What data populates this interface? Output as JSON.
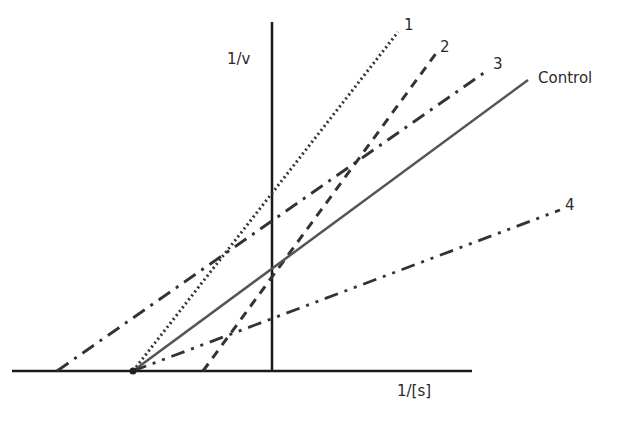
{
  "chart_data": {
    "type": "line",
    "title": "",
    "xlabel": "1/[s]",
    "ylabel": "1/v",
    "grid": false,
    "legend": "inline labels at line ends",
    "axes": {
      "x_axis": {
        "x1": 12,
        "x2": 472,
        "y": 371
      },
      "y_axis": {
        "x": 272,
        "y1": 22,
        "y2": 371
      }
    },
    "series": [
      {
        "name": "1",
        "style": "dotted",
        "color": "#333333",
        "x1": 133,
        "y1": 371,
        "x2": 398,
        "y2": 32
      },
      {
        "name": "2",
        "style": "dashed",
        "color": "#333333",
        "x1": 203,
        "y1": 371,
        "x2": 437,
        "y2": 52
      },
      {
        "name": "3",
        "style": "dash-dot",
        "color": "#333333",
        "x1": 57,
        "y1": 371,
        "x2": 488,
        "y2": 70
      },
      {
        "name": "Control",
        "style": "solid",
        "color": "#555555",
        "x1": 133,
        "y1": 371,
        "x2": 528,
        "y2": 80
      },
      {
        "name": "4",
        "style": "dash-dot-dot",
        "color": "#333333",
        "x1": 133,
        "y1": 371,
        "x2": 560,
        "y2": 210
      }
    ]
  },
  "labels": {
    "y_axis": "1/v",
    "x_axis": "1/[s]",
    "line1": "1",
    "line2": "2",
    "line3": "3",
    "control": "Control",
    "line4": "4"
  },
  "colors": {
    "axis": "#1a1a1a",
    "lines": "#333333",
    "control": "#555555",
    "text": "#2b2b2b"
  }
}
